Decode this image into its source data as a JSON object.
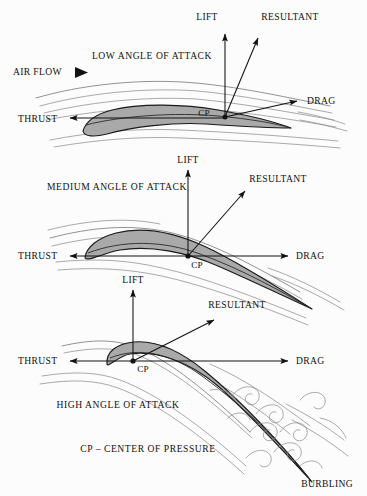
{
  "diagram": {
    "legend_note": "CP – CENTER OF PRESSURE",
    "airflow_label": "AIR FLOW",
    "airflow_icon": "solid-right-triangle-icon",
    "colors": {
      "airfoil_fill": "#a9a9a9",
      "airfoil_outline": "#1a1a1a",
      "streamline": "#8d8d8d",
      "vector": "#111111",
      "background": "#fcfcfc"
    },
    "panels": [
      {
        "id": "low",
        "heading": "LOW ANGLE OF ATTACK",
        "cp_label": "CP",
        "vectors": [
          {
            "name": "lift",
            "label": "LIFT"
          },
          {
            "name": "resultant",
            "label": "RESULTANT"
          },
          {
            "name": "drag",
            "label": "DRAG"
          },
          {
            "name": "thrust",
            "label": "THRUST"
          }
        ]
      },
      {
        "id": "medium",
        "heading": "MEDIUM ANGLE OF ATTACK",
        "cp_label": "CP",
        "vectors": [
          {
            "name": "lift",
            "label": "LIFT"
          },
          {
            "name": "resultant",
            "label": "RESULTANT"
          },
          {
            "name": "drag",
            "label": "DRAG"
          },
          {
            "name": "thrust",
            "label": "THRUST"
          }
        ]
      },
      {
        "id": "high",
        "heading": "HIGH ANGLE OF ATTACK",
        "cp_label": "CP",
        "burbling_label": "BURBLING",
        "vectors": [
          {
            "name": "lift",
            "label": "LIFT"
          },
          {
            "name": "resultant",
            "label": "RESULTANT"
          },
          {
            "name": "drag",
            "label": "DRAG"
          },
          {
            "name": "thrust",
            "label": "THRUST"
          }
        ]
      }
    ]
  }
}
